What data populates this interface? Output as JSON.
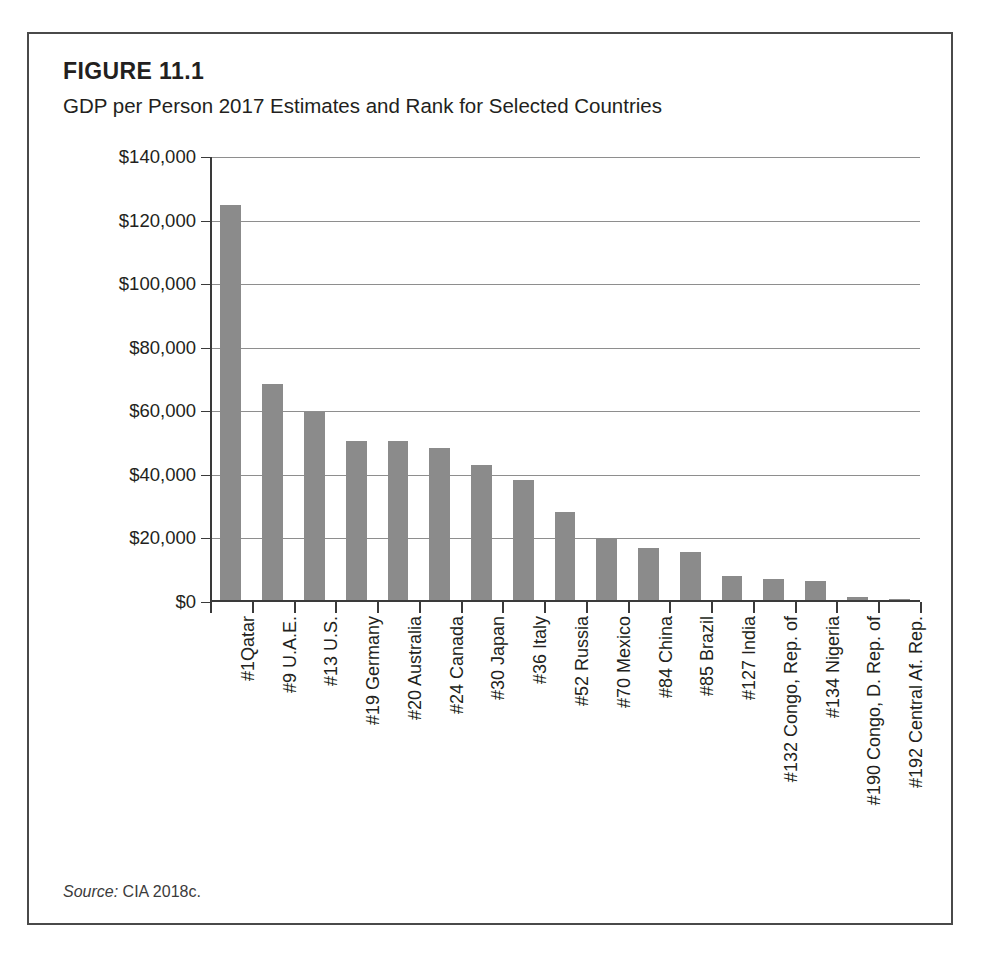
{
  "figure": {
    "heading": "FIGURE 11.1",
    "subtitle": "GDP per Person 2017 Estimates and Rank for Selected Countries",
    "source_label": "Source:",
    "source_value": "CIA 2018c."
  },
  "chart_data": {
    "type": "bar",
    "title": "GDP per Person 2017 Estimates and Rank for Selected Countries",
    "xlabel": "",
    "ylabel": "",
    "ylim": [
      0,
      140000
    ],
    "ytick_values": [
      0,
      20000,
      40000,
      60000,
      80000,
      100000,
      120000,
      140000
    ],
    "ytick_labels": [
      "$0",
      "$20,000",
      "$40,000",
      "$60,000",
      "$80,000",
      "$100,000",
      "$120,000",
      "$140,000"
    ],
    "grid": true,
    "legend": null,
    "bar_color": "#8b8b8b",
    "categories": [
      "#1Qatar",
      "#9 U.A.E.",
      "#13 U.S.",
      "#19 Germany",
      "#20 Australia",
      "#24 Canada",
      "#30 Japan",
      "#36 Italy",
      "#52 Russia",
      "#70 Mexico",
      "#84 China",
      "#85 Brazil",
      "#127 India",
      "#132 Congo, Rep. of",
      "#134 Nigeria",
      "#190 Congo, D. Rep. of",
      "#192 Central Af. Rep."
    ],
    "values": [
      125000,
      68500,
      59700,
      50800,
      50600,
      48300,
      43100,
      38300,
      28400,
      20200,
      17000,
      15800,
      8300,
      7200,
      6500,
      1500,
      1000
    ]
  }
}
